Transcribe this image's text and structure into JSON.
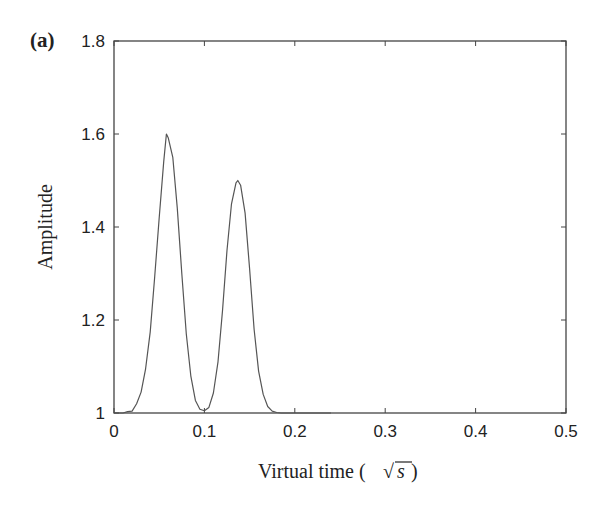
{
  "figure": {
    "panel_label": "(a)"
  },
  "chart_data": {
    "type": "line",
    "title": "",
    "xlabel": "Virtual time (√s)",
    "xlabel_parts": {
      "text": "Virtual time (",
      "radical": "√",
      "radicand": "s",
      "close": ")"
    },
    "ylabel": "Amplitude",
    "xlim": [
      0,
      0.5
    ],
    "ylim": [
      1,
      1.8
    ],
    "xticks": [
      "0",
      "0.1",
      "0.2",
      "0.3",
      "0.4",
      "0.5"
    ],
    "yticks": [
      "1",
      "1.2",
      "1.4",
      "1.6",
      "1.8"
    ],
    "grid": false,
    "legend": null,
    "line_color": "#555555",
    "values_are_estimates": true,
    "estimation_note": "Peak positions, heights and widths are read off the rendered image (about 1px resolution), not from labelled values. The series below is a two-Gaussian fit to those readings.",
    "peaks_approx": [
      {
        "x": 0.058,
        "y": 1.6,
        "sigma": 0.012
      },
      {
        "x": 0.137,
        "y": 1.5,
        "sigma": 0.012
      }
    ],
    "series": [
      {
        "name": "Amplitude",
        "x": [
          0,
          0.005,
          0.01,
          0.015,
          0.02,
          0.025,
          0.03,
          0.035,
          0.04,
          0.045,
          0.05,
          0.055,
          0.058,
          0.06,
          0.065,
          0.07,
          0.075,
          0.08,
          0.085,
          0.09,
          0.095,
          0.1,
          0.105,
          0.11,
          0.115,
          0.12,
          0.125,
          0.13,
          0.135,
          0.137,
          0.14,
          0.145,
          0.15,
          0.155,
          0.16,
          0.165,
          0.17,
          0.175,
          0.18,
          0.185,
          0.19,
          0.2,
          0.21,
          0.22,
          0.23,
          0.24
        ],
        "y": [
          1.0,
          1.0,
          1.0,
          1.003,
          1.004,
          1.02,
          1.045,
          1.095,
          1.174,
          1.293,
          1.42,
          1.54,
          1.6,
          1.592,
          1.55,
          1.44,
          1.3,
          1.17,
          1.08,
          1.027,
          1.008,
          1.005,
          1.012,
          1.043,
          1.11,
          1.22,
          1.35,
          1.45,
          1.495,
          1.5,
          1.49,
          1.43,
          1.31,
          1.18,
          1.09,
          1.04,
          1.014,
          1.004,
          1.001,
          1.0,
          1.0,
          1.0,
          1.0,
          1.0,
          1.0,
          1.0
        ]
      }
    ]
  }
}
